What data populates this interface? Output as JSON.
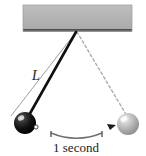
{
  "figure": {
    "name": "simple-pendulum-diagram",
    "background_color": "#ffffff",
    "width": 146,
    "height": 156
  },
  "ceiling": {
    "name": "ceiling-support-bar",
    "fill_color": "#b3b3b3",
    "edge_color": "#5a5a5a",
    "x": 23,
    "y": 5,
    "width": 109,
    "height": 27
  },
  "pivot": {
    "name": "pivot-point",
    "x": 76,
    "y": 32
  },
  "rods": {
    "outer_left": {
      "name": "pendulum-rod-left-extreme",
      "color": "#9a9a9a",
      "style": "solid-thin",
      "x1": 76,
      "y1": 32,
      "x2": 11,
      "y2": 116
    },
    "main": {
      "name": "pendulum-rod-current",
      "color": "#111111",
      "style": "solid-thick",
      "x1": 76,
      "y1": 32,
      "x2": 29,
      "y2": 116
    },
    "right_dashed": {
      "name": "pendulum-rod-right-extreme",
      "color": "#a8a8a8",
      "style": "dashed",
      "x1": 77,
      "y1": 32,
      "x2": 127,
      "y2": 116
    }
  },
  "bobs": {
    "dark": {
      "name": "pendulum-bob-dark",
      "cx": 25,
      "cy": 123,
      "r": 11,
      "color": "#111111",
      "highlight_color": "#f2f2f2"
    },
    "light": {
      "name": "pendulum-bob-light",
      "cx": 128,
      "cy": 124,
      "r": 11,
      "color": "#b0b0b0",
      "highlight_color": "#ededed"
    }
  },
  "markers": {
    "left_tick": {
      "name": "bob-direction-marker-left",
      "x": 35,
      "y": 127
    },
    "right_tick": {
      "name": "bob-direction-marker-right",
      "x": 113,
      "y": 127
    }
  },
  "annotations": {
    "length_label": {
      "name": "length-label",
      "text": "L",
      "x": 36,
      "y": 80
    },
    "period_caption": {
      "name": "period-caption",
      "text": "1 second",
      "x": 76,
      "y": 152
    },
    "period_arc": {
      "name": "period-span-arc",
      "color": "#6e6e6e",
      "x_start": 51,
      "x_end": 102,
      "y_top": 133,
      "y_bottom": 140
    }
  },
  "physics": {
    "quantity_shown": "L",
    "period_value": "1 second"
  }
}
